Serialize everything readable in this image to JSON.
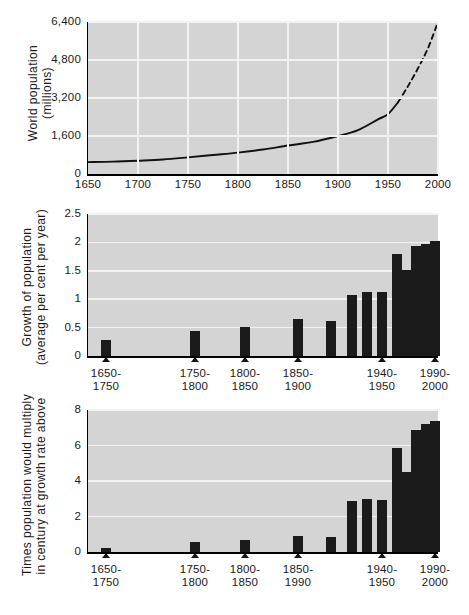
{
  "chart_data": [
    {
      "id": "world-population",
      "type": "line",
      "title": "",
      "xlabel": "",
      "ylabel": "World population\n(millions)",
      "ylabel_line1": "World population",
      "ylabel_line2": "(millions)",
      "xlim": [
        1650,
        2000
      ],
      "ylim": [
        0,
        6400
      ],
      "yticks": [
        0,
        1600,
        3200,
        4800,
        6400
      ],
      "ytick_labels": [
        "0",
        "1,600",
        "3,200",
        "4,800",
        "6,400"
      ],
      "xticks": [
        1650,
        1700,
        1750,
        1800,
        1850,
        1900,
        1950,
        2000
      ],
      "xtick_labels": [
        "1650",
        "1700",
        "1750",
        "1800",
        "1850",
        "1900",
        "1950",
        "2000"
      ],
      "grid": true,
      "legend": "none",
      "series": [
        {
          "name": "World population (solid, observed)",
          "style": "solid",
          "x": [
            1650,
            1675,
            1700,
            1725,
            1750,
            1775,
            1800,
            1825,
            1850,
            1875,
            1900,
            1920,
            1940,
            1950,
            1960
          ],
          "y": [
            500,
            520,
            560,
            610,
            700,
            800,
            900,
            1030,
            1200,
            1350,
            1600,
            1850,
            2300,
            2520,
            3020
          ]
        },
        {
          "name": "World population (dashed, projected)",
          "style": "dashed",
          "x": [
            1960,
            1970,
            1980,
            1990,
            2000
          ],
          "y": [
            3020,
            3700,
            4450,
            5300,
            6400
          ]
        }
      ]
    },
    {
      "id": "growth-of-population",
      "type": "bar",
      "title": "",
      "xlabel": "",
      "ylabel": "Growth of population\n(average per cent per year)",
      "ylabel_line1": "Growth of population",
      "ylabel_line2": "(average per cent per year)",
      "ylim": [
        0,
        2.5
      ],
      "yticks": [
        0,
        0.5,
        1,
        1.5,
        2,
        2.5
      ],
      "ytick_labels": [
        "0",
        "0.5",
        "1",
        "1.5",
        "2",
        "2.5"
      ],
      "grid": true,
      "legend": "none",
      "units": "average per cent per year",
      "categories": [
        "1650-1750",
        "1750-1800",
        "1800-1850",
        "1850-1900",
        "1900-1920",
        "1920-1930",
        "1930-1940",
        "1940-1950",
        "1950-1960",
        "1960-1970",
        "1970-1980",
        "1980-1990",
        "1990-2000"
      ],
      "values": [
        0.29,
        0.44,
        0.51,
        0.65,
        0.61,
        1.07,
        1.13,
        1.12,
        1.8,
        1.52,
        1.94,
        1.97,
        2.03
      ],
      "labeled_ticks": [
        {
          "label_line1": "1650-",
          "label_line2": "1750",
          "category_index": 0
        },
        {
          "label_line1": "1750-",
          "label_line2": "1800",
          "category_index": 1
        },
        {
          "label_line1": "1800-",
          "label_line2": "1850",
          "category_index": 2
        },
        {
          "label_line1": "1850-",
          "label_line2": "1900",
          "category_index": 3
        },
        {
          "label_line1": "1940-",
          "label_line2": "1950",
          "category_index": 7
        },
        {
          "label_line1": "1990-",
          "label_line2": "2000",
          "category_index": 12
        }
      ]
    },
    {
      "id": "times-population-would-multiply",
      "type": "bar",
      "title": "",
      "xlabel": "",
      "ylabel": "Times population would multiply\nin century at growth rate above",
      "ylabel_line1": "Times population would multiply",
      "ylabel_line2": "in century at growth rate above",
      "ylim": [
        0,
        8
      ],
      "yticks": [
        0,
        2,
        4,
        6,
        8
      ],
      "ytick_labels": [
        "0",
        "2",
        "4",
        "6",
        "8"
      ],
      "grid": true,
      "legend": "none",
      "categories": [
        "1650-1750",
        "1750-1800",
        "1800-1850",
        "1850-1990",
        "1900-1920",
        "1920-1930",
        "1930-1940",
        "1940-1950",
        "1950-1960",
        "1960-1970",
        "1970-1980",
        "1980-1990",
        "1990-2000"
      ],
      "values": [
        0.25,
        0.55,
        0.67,
        0.92,
        0.82,
        2.89,
        3.0,
        2.95,
        5.88,
        4.5,
        6.85,
        7.2,
        7.4
      ],
      "labeled_ticks": [
        {
          "label_line1": "1650-",
          "label_line2": "1750",
          "category_index": 0
        },
        {
          "label_line1": "1750-",
          "label_line2": "1800",
          "category_index": 1
        },
        {
          "label_line1": "1800-",
          "label_line2": "1850",
          "category_index": 2
        },
        {
          "label_line1": "1850-",
          "label_line2": "1990",
          "category_index": 3
        },
        {
          "label_line1": "1940-",
          "label_line2": "1950",
          "category_index": 7
        },
        {
          "label_line1": "1990-",
          "label_line2": "2000",
          "category_index": 12
        }
      ]
    }
  ],
  "colors": {
    "plot_background": "#d4d4d4",
    "bar_fill": "#1b1b1b",
    "gridline": "#f2f2f2",
    "axis": "#000000",
    "text": "#1a1a1a",
    "page_background": "#ffffff"
  }
}
